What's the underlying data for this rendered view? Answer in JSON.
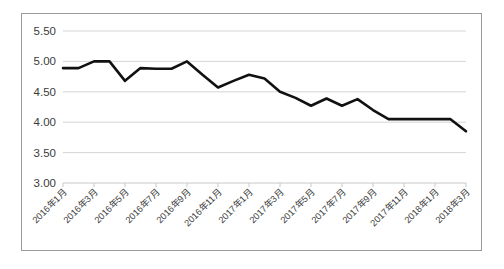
{
  "chart_data": {
    "type": "line",
    "title": "",
    "subtitle": "",
    "xlabel": "",
    "ylabel": "",
    "ylim": [
      3.0,
      5.5
    ],
    "ytick_labels": [
      "5.50",
      "5.00",
      "4.50",
      "4.00",
      "3.50",
      "3.00"
    ],
    "ytick_values": [
      5.5,
      5.0,
      4.5,
      4.0,
      3.5,
      3.0
    ],
    "grid": true,
    "legend": "none",
    "tick_label_rotation": -45,
    "tick_label_interval_months": 2,
    "xtick_labels": [
      "2016年1月",
      "2016年3月",
      "2016年5月",
      "2016年7月",
      "2016年9月",
      "2016年11月",
      "2017年1月",
      "2017年3月",
      "2017年5月",
      "2017年7月",
      "2017年9月",
      "2017年11月",
      "2018年1月",
      "2018年3月"
    ],
    "x": [
      "2016年1月",
      "2016年2月",
      "2016年3月",
      "2016年4月",
      "2016年5月",
      "2016年6月",
      "2016年7月",
      "2016年8月",
      "2016年9月",
      "2016年10月",
      "2016年11月",
      "2016年12月",
      "2017年1月",
      "2017年2月",
      "2017年3月",
      "2017年4月",
      "2017年5月",
      "2017年6月",
      "2017年7月",
      "2017年8月",
      "2017年9月",
      "2017年10月",
      "2017年11月",
      "2017年12月",
      "2018年1月",
      "2018年2月",
      "2018年3月"
    ],
    "values": [
      4.89,
      4.89,
      5.0,
      5.0,
      4.68,
      4.89,
      4.88,
      4.88,
      5.0,
      4.78,
      4.57,
      4.68,
      4.78,
      4.72,
      4.5,
      4.4,
      4.27,
      4.39,
      4.27,
      4.38,
      4.2,
      4.05,
      4.05,
      4.05,
      4.05,
      4.05,
      3.85
    ],
    "series_name": "数值",
    "line_color": "#111111",
    "grid_color": "#d5d5d5",
    "border_color": "#9a9a9a",
    "background_color": "#ffffff"
  }
}
